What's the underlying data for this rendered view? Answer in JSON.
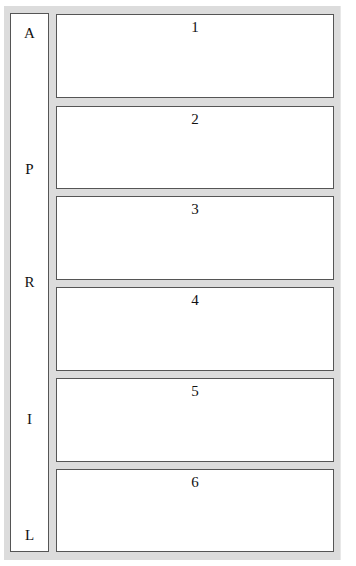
{
  "side_column": {
    "letters": [
      {
        "char": "A",
        "top": 10
      },
      {
        "char": "P",
        "top": 146
      },
      {
        "char": "R",
        "top": 259
      },
      {
        "char": "I",
        "top": 396
      },
      {
        "char": "L",
        "top": 512
      }
    ]
  },
  "boxes": [
    {
      "label": "1",
      "top": 14,
      "height": 84
    },
    {
      "label": "2",
      "top": 106,
      "height": 83
    },
    {
      "label": "3",
      "top": 196,
      "height": 84
    },
    {
      "label": "4",
      "top": 287,
      "height": 84
    },
    {
      "label": "5",
      "top": 378,
      "height": 84
    },
    {
      "label": "6",
      "top": 469,
      "height": 83
    }
  ],
  "colors": {
    "frame": "#dcdcdc",
    "border": "#555555",
    "panel": "#ffffff"
  }
}
